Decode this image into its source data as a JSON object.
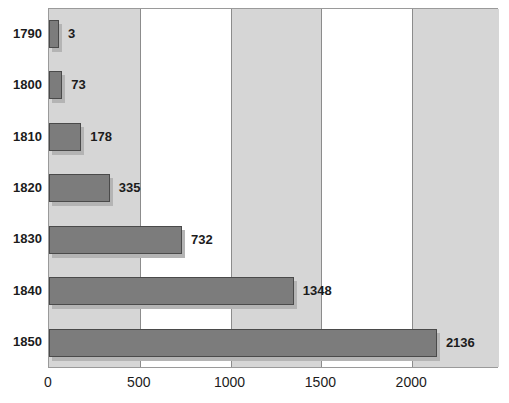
{
  "chart_data": {
    "type": "bar",
    "orientation": "horizontal",
    "title": "",
    "xlabel": "",
    "ylabel": "",
    "categories": [
      "1790",
      "1800",
      "1810",
      "1820",
      "1830",
      "1840",
      "1850"
    ],
    "values": [
      3,
      73,
      178,
      335,
      732,
      1348,
      2136
    ],
    "value_labels": [
      "3",
      "73",
      "178",
      "335",
      "732",
      "1348",
      "2136"
    ],
    "xlim": [
      0,
      2478
    ],
    "xticks": [
      0,
      500,
      1000,
      1500,
      2000
    ],
    "xtick_labels": [
      "0",
      "500",
      "1000",
      "1500",
      "2000"
    ],
    "grid": true,
    "grid_axis": "x",
    "legend": null,
    "banding": "alternating vertical gray/white between x gridlines",
    "colors": {
      "bar_fill": "#7c7c7c",
      "bar_border": "#4a4a4a",
      "bar_shadow": "#b4b4b4",
      "band_gray": "#d6d6d6",
      "band_white": "#ffffff",
      "gridline": "#8c8c8c",
      "plot_border": "#9a9a9a",
      "text": "#1c1c1c",
      "page_background": "#ffffff"
    }
  }
}
